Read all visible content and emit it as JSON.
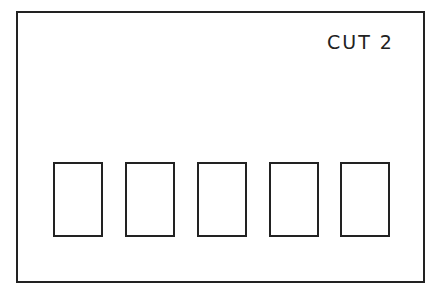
{
  "diagram": {
    "label": "CUT 2",
    "slots": [
      {
        "id": 1,
        "x": 53
      },
      {
        "id": 2,
        "x": 125
      },
      {
        "id": 3,
        "x": 197
      },
      {
        "id": 4,
        "x": 269
      },
      {
        "id": 5,
        "x": 340
      }
    ],
    "stroke_color": "#222222",
    "background_color": "#ffffff"
  }
}
